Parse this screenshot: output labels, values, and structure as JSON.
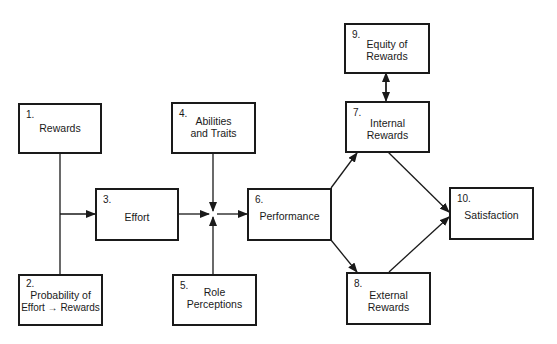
{
  "diagram": {
    "type": "flow-model",
    "nodes": [
      {
        "id": 1,
        "number": "1.",
        "line1": "Rewards",
        "line2": ""
      },
      {
        "id": 2,
        "number": "2.",
        "line1": "Probability of",
        "line2": "Effort → Rewards"
      },
      {
        "id": 3,
        "number": "3.",
        "line1": "Effort",
        "line2": ""
      },
      {
        "id": 4,
        "number": "4.",
        "line1": "Abilities",
        "line2": "and Traits"
      },
      {
        "id": 5,
        "number": "5.",
        "line1": "Role",
        "line2": "Perceptions"
      },
      {
        "id": 6,
        "number": "6.",
        "line1": "Performance",
        "line2": ""
      },
      {
        "id": 7,
        "number": "7.",
        "line1": "Internal",
        "line2": "Rewards"
      },
      {
        "id": 8,
        "number": "8.",
        "line1": "External",
        "line2": "Rewards"
      },
      {
        "id": 9,
        "number": "9.",
        "line1": "Equity of",
        "line2": "Rewards"
      },
      {
        "id": 10,
        "number": "10.",
        "line1": "Satisfaction",
        "line2": ""
      }
    ],
    "edges": [
      {
        "from": "1+2",
        "to": 3,
        "style": "arrow"
      },
      {
        "from": "3+4+5",
        "to": 6,
        "style": "arrow (via junction)"
      },
      {
        "from": 6,
        "to": 7,
        "style": "arrow"
      },
      {
        "from": 6,
        "to": 8,
        "style": "arrow"
      },
      {
        "from": 7,
        "to": 10,
        "style": "arrow"
      },
      {
        "from": 8,
        "to": 10,
        "style": "arrow"
      },
      {
        "from": 9,
        "to": 7,
        "style": "bidirectional arrow"
      }
    ],
    "colors": {
      "line": "#1a1a1a",
      "background": "#ffffff"
    }
  }
}
